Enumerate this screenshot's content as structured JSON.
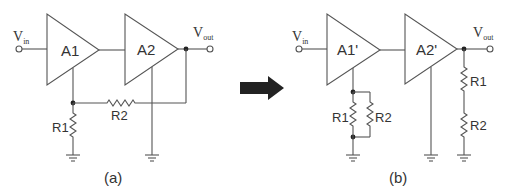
{
  "figure": {
    "arrow": {
      "direction": "right",
      "color": "#222222"
    },
    "panel_a": {
      "caption": "(a)",
      "input_label": {
        "main": "V",
        "sub": "in"
      },
      "output_label": {
        "main": "V",
        "sub": "out"
      },
      "amplifiers": [
        {
          "label": "A1"
        },
        {
          "label": "A2"
        }
      ],
      "resistors": [
        {
          "label": "R1"
        },
        {
          "label": "R2"
        }
      ]
    },
    "panel_b": {
      "caption": "(b)",
      "input_label": {
        "main": "V",
        "sub": "in"
      },
      "output_label": {
        "main": "V",
        "sub": "out"
      },
      "amplifiers": [
        {
          "label": "A1'"
        },
        {
          "label": "A2'"
        }
      ],
      "parallel_resistors": [
        {
          "label": "R1"
        },
        {
          "label": "R2"
        }
      ],
      "series_resistors": [
        {
          "label": "R1"
        },
        {
          "label": "R2"
        }
      ]
    }
  }
}
